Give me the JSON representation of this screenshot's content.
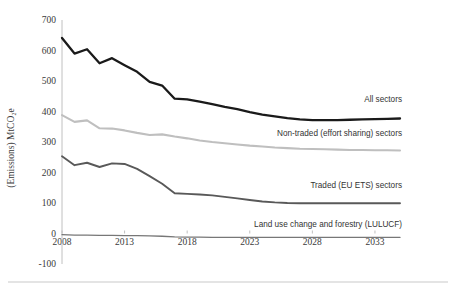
{
  "chart_data": {
    "type": "line",
    "title": "",
    "subtitle": "",
    "xlabel": "",
    "ylabel": "(Emissions) MtCO₂e",
    "xlim": [
      2008,
      2035
    ],
    "ylim": [
      -100,
      700
    ],
    "grid": false,
    "legend_position": "inline-right-of-series",
    "x_tick_labels": [
      "2008",
      "2013",
      "2018",
      "2023",
      "2028",
      "2033"
    ],
    "x_ticks": [
      2008,
      2013,
      2018,
      2023,
      2028,
      2033
    ],
    "y_tick_labels": [
      "-100",
      "0",
      "100",
      "200",
      "300",
      "400",
      "500",
      "600",
      "700"
    ],
    "y_ticks": [
      -100,
      0,
      100,
      200,
      300,
      400,
      500,
      600,
      700
    ],
    "x": [
      2008,
      2009,
      2010,
      2011,
      2012,
      2013,
      2014,
      2015,
      2016,
      2017,
      2018,
      2019,
      2020,
      2021,
      2022,
      2023,
      2024,
      2025,
      2026,
      2027,
      2028,
      2029,
      2030,
      2031,
      2032,
      2033,
      2034,
      2035
    ],
    "series": [
      {
        "name": "All sectors",
        "color": "#1a1a1a",
        "width": 2.3,
        "label_x": 2033.0,
        "label_y": 430,
        "values": [
          641,
          590,
          604,
          558,
          575,
          552,
          530,
          497,
          485,
          442,
          440,
          432,
          424,
          415,
          408,
          398,
          390,
          384,
          378,
          374,
          372,
          372,
          372,
          373,
          374,
          375,
          376,
          377
        ]
      },
      {
        "name": "Non-traded (effort sharing) sectors",
        "color": "#bfbfbf",
        "width": 2.1,
        "label_x": 2025.5,
        "label_y": 320,
        "values": [
          388,
          366,
          371,
          345,
          344,
          338,
          330,
          323,
          325,
          318,
          312,
          305,
          300,
          296,
          292,
          288,
          285,
          282,
          280,
          278,
          277,
          276,
          275,
          274,
          274,
          273,
          273,
          272
        ]
      },
      {
        "name": "Traded (EU ETS) sectors",
        "color": "#595959",
        "width": 1.9,
        "label_x": 2026.0,
        "label_y": 150,
        "values": [
          253,
          224,
          232,
          218,
          230,
          228,
          212,
          188,
          163,
          132,
          130,
          128,
          125,
          120,
          115,
          110,
          105,
          102,
          100,
          99,
          99,
          99,
          99,
          99,
          99,
          99,
          99,
          99
        ]
      },
      {
        "name": "Land use change and forestry (LULUCF)",
        "color": "#777777",
        "width": 1.3,
        "label_x": 2022.0,
        "label_y": 22,
        "values": [
          -4,
          -5,
          -5,
          -6,
          -6,
          -7,
          -7,
          -8,
          -9,
          -11,
          -12,
          -12,
          -13,
          -13,
          -13,
          -13,
          -13,
          -13,
          -13,
          -13,
          -13,
          -13,
          -13,
          -13,
          -13,
          -13,
          -13,
          -13
        ]
      }
    ]
  },
  "axis": {
    "y_title": "(Emissions) MtCO₂e"
  }
}
